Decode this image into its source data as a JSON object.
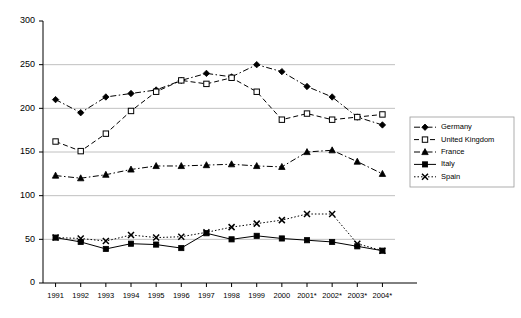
{
  "chart_data": {
    "type": "line",
    "title": "",
    "xlabel": "",
    "ylabel": "",
    "ylim": [
      0,
      300
    ],
    "yticks": [
      0,
      50,
      100,
      150,
      200,
      250,
      300
    ],
    "grid": true,
    "grid_axis": "y",
    "legend_position": "right",
    "categories": [
      "1991",
      "1992",
      "1993",
      "1994",
      "1995",
      "1996",
      "1997",
      "1998",
      "1999",
      "2000",
      "2001*",
      "2002*",
      "2003*",
      "2004*"
    ],
    "series": [
      {
        "name": "Germany",
        "marker": "diamond",
        "dash": "dash-dot",
        "values": [
          210,
          195,
          213,
          217,
          221,
          232,
          240,
          236,
          250,
          242,
          225,
          213,
          190,
          181
        ]
      },
      {
        "name": "United Kingdom",
        "marker": "open-square",
        "dash": "dashed",
        "values": [
          162,
          151,
          171,
          197,
          219,
          232,
          228,
          235,
          219,
          187,
          194,
          187,
          190,
          193
        ]
      },
      {
        "name": "France",
        "marker": "triangle",
        "dash": "dash-dot",
        "values": [
          123,
          120,
          124,
          130,
          134,
          134,
          135,
          136,
          134,
          133,
          150,
          152,
          139,
          125
        ]
      },
      {
        "name": "Italy",
        "marker": "filled-square",
        "dash": "solid",
        "values": [
          52,
          47,
          39,
          45,
          44,
          40,
          57,
          50,
          54,
          51,
          49,
          47,
          42,
          37
        ]
      },
      {
        "name": "Spain",
        "marker": "cross",
        "dash": "dotted",
        "values": [
          52,
          51,
          48,
          55,
          52,
          53,
          58,
          64,
          68,
          72,
          79,
          79,
          45,
          37
        ]
      }
    ]
  },
  "axes": {
    "y_tick_labels": [
      "0",
      "50",
      "100",
      "150",
      "200",
      "250",
      "300"
    ],
    "x_tick_labels": [
      "1991",
      "1992",
      "1993",
      "1994",
      "1995",
      "1996",
      "1997",
      "1998",
      "1999",
      "2000",
      "2001*",
      "2002*",
      "2003*",
      "2004*"
    ]
  },
  "legend": {
    "entries": [
      {
        "label": "Germany"
      },
      {
        "label": "United Kingdom"
      },
      {
        "label": "France"
      },
      {
        "label": "Italy"
      },
      {
        "label": "Spain"
      }
    ]
  },
  "colors": {
    "ink": "#000000",
    "grid": "#b0b0b0",
    "background": "#ffffff"
  }
}
